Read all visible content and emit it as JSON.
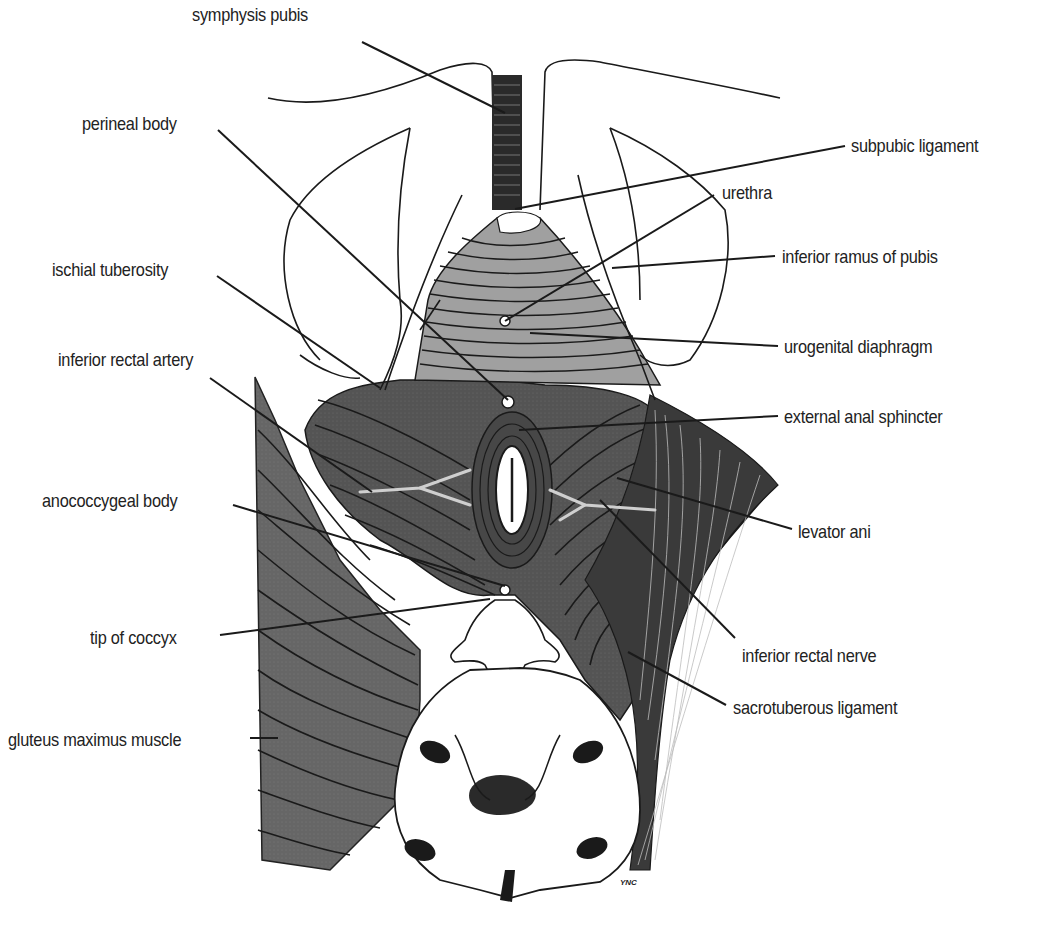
{
  "figure": {
    "signature": "YNC",
    "colors": {
      "muscle_dark": "#505050",
      "muscle_medium": "#6a6a6a",
      "muscle_light": "#8a8a8a",
      "urogenital_fill": "#9a9a9a",
      "bone": "#ffffff",
      "line": "#1a1a1a",
      "leader_on_dark": "#d8d8d8"
    }
  },
  "labels": [
    {
      "id": "symphysis-pubis",
      "text": "symphysis pubis",
      "side": "left",
      "x": 192,
      "y": 4,
      "leader": [
        [
          362,
          42
        ],
        [
          505,
          113
        ]
      ]
    },
    {
      "id": "perineal-body",
      "text": "perineal body",
      "side": "left",
      "x": 82,
      "y": 113,
      "leader": [
        [
          218,
          130
        ],
        [
          508,
          400
        ]
      ]
    },
    {
      "id": "ischial-tuberosity",
      "text": "ischial tuberosity",
      "side": "left",
      "x": 52,
      "y": 259,
      "leader": [
        [
          217,
          276
        ],
        [
          380,
          388
        ]
      ]
    },
    {
      "id": "inferior-rectal-artery",
      "text": "inferior rectal artery",
      "side": "left",
      "x": 58,
      "y": 349,
      "leader": [
        [
          210,
          378
        ],
        [
          372,
          492
        ]
      ]
    },
    {
      "id": "anococcygeal-body",
      "text": "anococcygeal body",
      "side": "left",
      "x": 42,
      "y": 490,
      "leader": [
        [
          233,
          505
        ],
        [
          505,
          586
        ]
      ]
    },
    {
      "id": "tip-of-coccyx",
      "text": "tip of coccyx",
      "side": "left",
      "x": 90,
      "y": 627,
      "leader": [
        [
          220,
          635
        ],
        [
          490,
          599
        ]
      ]
    },
    {
      "id": "gluteus-maximus-muscle",
      "text": "gluteus maximus muscle",
      "side": "left",
      "x": 8,
      "y": 729,
      "leader": [
        [
          250,
          738
        ],
        [
          278,
          738
        ]
      ]
    },
    {
      "id": "subpubic-ligament",
      "text": "subpubic ligament",
      "side": "right",
      "x": 851,
      "y": 135,
      "leader": [
        [
          845,
          146
        ],
        [
          515,
          209
        ]
      ]
    },
    {
      "id": "urethra",
      "text": "urethra",
      "side": "right",
      "x": 722,
      "y": 182,
      "leader": [
        [
          714,
          195
        ],
        [
          505,
          321
        ]
      ]
    },
    {
      "id": "inferior-ramus-of-pubis",
      "text": "inferior ramus of pubis",
      "side": "right",
      "x": 782,
      "y": 246,
      "leader": [
        [
          775,
          256
        ],
        [
          612,
          268
        ]
      ]
    },
    {
      "id": "urogenital-diaphragm",
      "text": "urogenital diaphragm",
      "side": "right",
      "x": 784,
      "y": 336,
      "leader": [
        [
          778,
          346
        ],
        [
          530,
          333
        ]
      ]
    },
    {
      "id": "external-anal-sphincter",
      "text": "external anal sphincter",
      "side": "right",
      "x": 784,
      "y": 406,
      "leader": [
        [
          778,
          416
        ],
        [
          519,
          430
        ]
      ]
    },
    {
      "id": "levator-ani",
      "text": "levator ani",
      "side": "right",
      "x": 798,
      "y": 521,
      "leader": [
        [
          792,
          529
        ],
        [
          617,
          478
        ]
      ]
    },
    {
      "id": "inferior-rectal-nerve",
      "text": "inferior rectal nerve",
      "side": "right",
      "x": 742,
      "y": 645,
      "leader": [
        [
          735,
          638
        ],
        [
          600,
          500
        ]
      ]
    },
    {
      "id": "sacrotuberous-ligament",
      "text": "sacrotuberous ligament",
      "side": "right",
      "x": 733,
      "y": 697,
      "leader": [
        [
          726,
          705
        ],
        [
          628,
          652
        ]
      ]
    }
  ]
}
